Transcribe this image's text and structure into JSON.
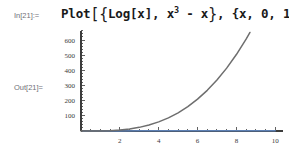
{
  "notebook": {
    "background_color": "#ffffff",
    "input_cell": {
      "label": "In[21]:=",
      "expression_plain": "Plot[{Log[x], x^3 - x}, {x, 0, 10}]",
      "tokens": {
        "function": "Plot",
        "open_bracket": "[",
        "open_brace": "{",
        "arg1": "Log[x]",
        "comma1": ", ",
        "arg2_base": "x",
        "arg2_exponent": "3",
        "arg2_tail": " - x",
        "close_brace": "}",
        "comma2": ", ",
        "range": "{x, 0, 10}",
        "close_bracket": "]"
      }
    },
    "output_cell": {
      "label": "Out[21]=",
      "graphic_kind": "plot"
    }
  },
  "chart_data": {
    "type": "line",
    "title": "",
    "xlabel": "",
    "ylabel": "",
    "xlim": [
      0,
      10.4
    ],
    "ylim": [
      -30,
      660
    ],
    "grid": false,
    "legend": false,
    "axis_color": "#3c3c3c",
    "xticks": [
      2,
      4,
      6,
      8,
      10
    ],
    "xtick_labels": [
      "2",
      "4",
      "6",
      "8",
      "10"
    ],
    "yticks": [
      100,
      200,
      300,
      400,
      500,
      600
    ],
    "ytick_labels": [
      "100",
      "200",
      "300",
      "400",
      "500",
      "600"
    ],
    "x_minor_tick_step": 0.5,
    "y_minor_tick_step": 20,
    "series": [
      {
        "name": "Log[x]",
        "color": "#5e81b5",
        "expression": "Log[x]",
        "x": [
          0.1,
          0.5,
          1,
          2,
          3,
          4,
          5,
          6,
          7,
          8,
          9,
          10
        ],
        "values": [
          -2.3,
          -0.69,
          0,
          0.69,
          1.1,
          1.39,
          1.61,
          1.79,
          1.95,
          2.08,
          2.2,
          2.3
        ],
        "note": "flat along the x-axis at this vertical scale"
      },
      {
        "name": "x^3 - x",
        "color": "#6e6e6e",
        "expression": "x^3 - x",
        "x": [
          0,
          0.5,
          1,
          1.5,
          2,
          2.5,
          3,
          3.5,
          4,
          4.5,
          5,
          5.5,
          6,
          6.5,
          7,
          7.5,
          8,
          8.5,
          8.7
        ],
        "values": [
          0,
          -0.375,
          0,
          1.875,
          6,
          13.1,
          24,
          39.4,
          60,
          86.6,
          120,
          160.9,
          210,
          268.1,
          336,
          414.4,
          504,
          605.6,
          649.6
        ]
      }
    ]
  }
}
